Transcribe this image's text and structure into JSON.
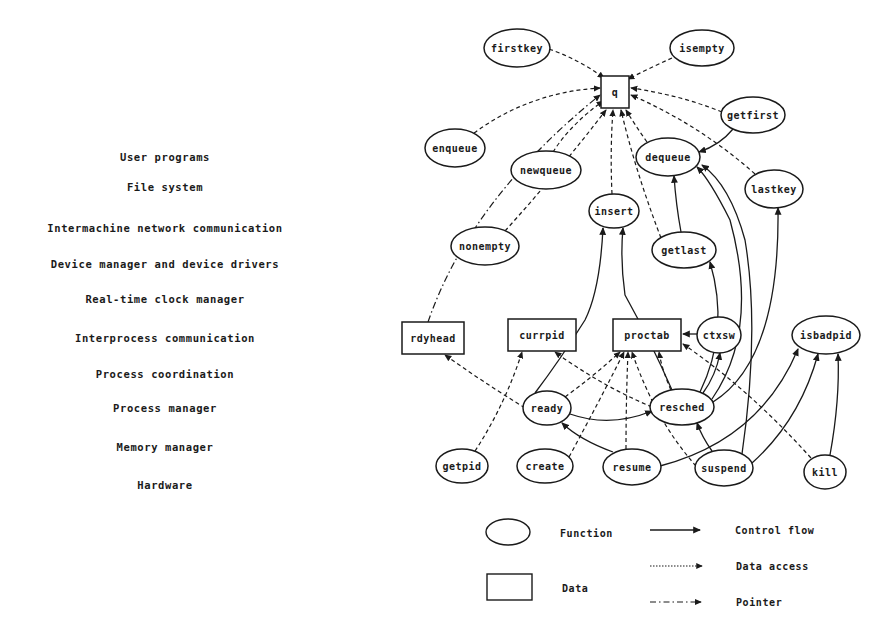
{
  "layers": [
    {
      "label": "User programs",
      "y": 157
    },
    {
      "label": "File system",
      "y": 187
    },
    {
      "label": "Intermachine network communication",
      "y": 228
    },
    {
      "label": "Device manager and device drivers",
      "y": 264
    },
    {
      "label": "Real-time clock manager",
      "y": 299
    },
    {
      "label": "Interprocess communication",
      "y": 338
    },
    {
      "label": "Process coordination",
      "y": 374
    },
    {
      "label": "Process manager",
      "y": 408
    },
    {
      "label": "Memory manager",
      "y": 447
    },
    {
      "label": "Hardware",
      "y": 485
    }
  ],
  "nodes": [
    {
      "id": "firstkey",
      "label": "firstkey",
      "type": "function",
      "x": 517,
      "y": 48,
      "rx": 33,
      "ry": 19
    },
    {
      "id": "isempty",
      "label": "isempty",
      "type": "function",
      "x": 702,
      "y": 48,
      "rx": 32,
      "ry": 18
    },
    {
      "id": "q",
      "label": "q",
      "type": "data",
      "x": 615,
      "y": 92,
      "w": 28,
      "h": 32
    },
    {
      "id": "getfirst",
      "label": "getfirst",
      "type": "function",
      "x": 753,
      "y": 115,
      "rx": 32,
      "ry": 18
    },
    {
      "id": "enqueue",
      "label": "enqueue",
      "type": "function",
      "x": 455,
      "y": 148,
      "rx": 30,
      "ry": 19
    },
    {
      "id": "dequeue",
      "label": "dequeue",
      "type": "function",
      "x": 668,
      "y": 157,
      "rx": 32,
      "ry": 19
    },
    {
      "id": "newqueue",
      "label": "newqueue",
      "type": "function",
      "x": 546,
      "y": 170,
      "rx": 35,
      "ry": 19
    },
    {
      "id": "lastkey",
      "label": "lastkey",
      "type": "function",
      "x": 774,
      "y": 189,
      "rx": 29,
      "ry": 19
    },
    {
      "id": "insert",
      "label": "insert",
      "type": "function",
      "x": 614,
      "y": 211,
      "rx": 25,
      "ry": 17
    },
    {
      "id": "nonempty",
      "label": "nonempty",
      "type": "function",
      "x": 485,
      "y": 246,
      "rx": 34,
      "ry": 19
    },
    {
      "id": "getlast",
      "label": "getlast",
      "type": "function",
      "x": 684,
      "y": 250,
      "rx": 32,
      "ry": 18
    },
    {
      "id": "rdyhead",
      "label": "rdyhead",
      "type": "data",
      "x": 433,
      "y": 338,
      "w": 62,
      "h": 32
    },
    {
      "id": "currpid",
      "label": "currpid",
      "type": "data",
      "x": 542,
      "y": 335,
      "w": 68,
      "h": 32
    },
    {
      "id": "proctab",
      "label": "proctab",
      "type": "data",
      "x": 647,
      "y": 335,
      "w": 68,
      "h": 32
    },
    {
      "id": "ctxsw",
      "label": "ctxsw",
      "type": "function",
      "x": 719,
      "y": 335,
      "rx": 22,
      "ry": 18
    },
    {
      "id": "isbadpid",
      "label": "isbadpid",
      "type": "function",
      "x": 826,
      "y": 335,
      "rx": 34,
      "ry": 19
    },
    {
      "id": "ready",
      "label": "ready",
      "type": "function",
      "x": 547,
      "y": 408,
      "rx": 24,
      "ry": 17
    },
    {
      "id": "resched",
      "label": "resched",
      "type": "function",
      "x": 682,
      "y": 407,
      "rx": 32,
      "ry": 18
    },
    {
      "id": "getpid",
      "label": "getpid",
      "type": "function",
      "x": 462,
      "y": 466,
      "rx": 26,
      "ry": 17
    },
    {
      "id": "create",
      "label": "create",
      "type": "function",
      "x": 545,
      "y": 466,
      "rx": 28,
      "ry": 17
    },
    {
      "id": "resume",
      "label": "resume",
      "type": "function",
      "x": 632,
      "y": 467,
      "rx": 29,
      "ry": 18
    },
    {
      "id": "suspend",
      "label": "suspend",
      "type": "function",
      "x": 724,
      "y": 468,
      "rx": 29,
      "ry": 18
    },
    {
      "id": "kill",
      "label": "kill",
      "type": "function",
      "x": 825,
      "y": 472,
      "rx": 21,
      "ry": 17
    }
  ],
  "edges": [
    {
      "from": "firstkey",
      "to": "q",
      "kind": "data",
      "d": "M549,49 Q580,60 604,78"
    },
    {
      "from": "isempty",
      "to": "q",
      "kind": "data",
      "d": "M672,58 Q650,68 628,79"
    },
    {
      "from": "getfirst",
      "to": "q",
      "kind": "data",
      "d": "M722,112 Q680,95 631,88"
    },
    {
      "from": "getfirst",
      "to": "dequeue",
      "kind": "control",
      "d": "M733,129 Q720,145 699,152"
    },
    {
      "from": "enqueue",
      "to": "q",
      "kind": "data",
      "d": "M474,133 Q530,92 600,88"
    },
    {
      "from": "rdyhead",
      "to": "q",
      "kind": "pointer",
      "d": "M428,322 Q470,200 600,95"
    },
    {
      "from": "newqueue",
      "to": "q",
      "kind": "data",
      "d": "M553,152 Q570,125 603,101"
    },
    {
      "from": "nonempty",
      "to": "q",
      "kind": "data",
      "d": "M505,231 Q560,170 606,110"
    },
    {
      "from": "insert",
      "to": "q",
      "kind": "data",
      "d": "M612,194 Q610,150 613,110"
    },
    {
      "from": "getlast",
      "to": "q",
      "kind": "data",
      "d": "M661,238 Q635,170 621,110"
    },
    {
      "from": "dequeue",
      "to": "q",
      "kind": "data",
      "d": "M647,142 Q635,125 626,110"
    },
    {
      "from": "lastkey",
      "to": "q",
      "kind": "data",
      "d": "M755,174 Q700,125 631,95"
    },
    {
      "from": "getlast",
      "to": "dequeue",
      "kind": "control",
      "d": "M681,232 Q676,205 674,176"
    },
    {
      "from": "ready",
      "to": "insert",
      "kind": "control",
      "d": "M535,393 Q560,360 585,320 Q600,290 603,228"
    },
    {
      "from": "resched",
      "to": "insert",
      "kind": "control",
      "d": "M672,390 Q650,340 625,295 Q620,260 623,228"
    },
    {
      "from": "resched",
      "to": "getlast",
      "kind": "control",
      "d": "M700,392 Q730,330 710,262"
    },
    {
      "from": "resched",
      "to": "dequeue",
      "kind": "control",
      "d": "M712,399 Q760,330 730,220 Q710,180 697,167"
    },
    {
      "from": "suspend",
      "to": "dequeue",
      "kind": "control",
      "d": "M742,454 Q760,330 745,240 Q730,185 702,165"
    },
    {
      "from": "resched",
      "to": "lastkey",
      "kind": "control",
      "d": "M713,402 Q780,360 778,208"
    },
    {
      "from": "rdyhead_ptr_cont",
      "to": "rdyhead",
      "kind": "pointer",
      "d": ""
    },
    {
      "from": "ctxsw",
      "to": "proctab",
      "kind": "control",
      "d": "M697,334 L683,334"
    },
    {
      "from": "resched",
      "to": "ctxsw",
      "kind": "control",
      "d": "M703,393 Q716,375 720,353"
    },
    {
      "from": "resched",
      "to": "proctab",
      "kind": "data",
      "d": "M671,390 Q662,370 659,352"
    },
    {
      "from": "ready",
      "to": "rdyhead",
      "kind": "data",
      "d": "M525,408 Q480,380 445,355"
    },
    {
      "from": "resched",
      "to": "currpid",
      "kind": "data",
      "d": "M652,407 Q600,385 555,352"
    },
    {
      "from": "ready",
      "to": "proctab",
      "kind": "data",
      "d": "M565,397 Q595,375 620,352"
    },
    {
      "from": "ready",
      "to": "resched",
      "kind": "control",
      "d": "M570,414 Q610,428 652,411"
    },
    {
      "from": "getpid",
      "to": "currpid",
      "kind": "data",
      "d": "M475,451 Q505,405 522,352"
    },
    {
      "from": "create",
      "to": "proctab",
      "kind": "data",
      "d": "M569,457 Q600,400 624,352"
    },
    {
      "from": "resume",
      "to": "proctab",
      "kind": "data",
      "d": "M626,449 Q626,400 628,352"
    },
    {
      "from": "resume",
      "to": "ready",
      "kind": "control",
      "d": "M613,452 Q580,440 562,423"
    },
    {
      "from": "resume",
      "to": "isbadpid",
      "kind": "control",
      "d": "M660,466 Q760,440 798,349"
    },
    {
      "from": "suspend",
      "to": "proctab",
      "kind": "data",
      "d": "M696,466 Q655,420 632,352"
    },
    {
      "from": "suspend",
      "to": "resched",
      "kind": "control",
      "d": "M712,451 Q702,437 697,423"
    },
    {
      "from": "suspend",
      "to": "isbadpid",
      "kind": "control",
      "d": "M752,463 Q800,420 818,354"
    },
    {
      "from": "kill",
      "to": "proctab",
      "kind": "data",
      "d": "M811,458 Q750,390 683,344"
    },
    {
      "from": "kill",
      "to": "isbadpid",
      "kind": "control",
      "d": "M830,455 Q840,400 838,354"
    }
  ],
  "legend": {
    "shapes": [
      {
        "kind": "function",
        "label": "Function"
      },
      {
        "kind": "data",
        "label": "Data"
      }
    ],
    "lines": [
      {
        "kind": "control",
        "label": "Control flow"
      },
      {
        "kind": "data",
        "label": "Data access"
      },
      {
        "kind": "pointer",
        "label": "Pointer"
      }
    ]
  }
}
